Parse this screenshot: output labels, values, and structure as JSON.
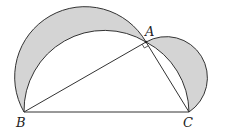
{
  "diagram": {
    "type": "geometry",
    "points": {
      "A": {
        "label": "A",
        "x": 146,
        "y": 42
      },
      "B": {
        "label": "B",
        "x": 24,
        "y": 112
      },
      "C": {
        "label": "C",
        "x": 189,
        "y": 112
      }
    },
    "right_angle_at": "A",
    "colors": {
      "shade": "#d4d4d4",
      "stroke": "#333333",
      "background": "#ffffff"
    }
  },
  "labels": {
    "A": "A",
    "B": "B",
    "C": "C"
  }
}
